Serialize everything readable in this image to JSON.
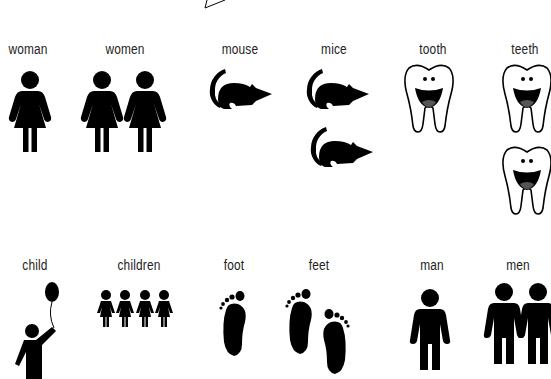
{
  "title_fragment": "",
  "colors": {
    "ink": "#000000",
    "background": "#ffffff",
    "text": "#222222"
  },
  "row1": [
    {
      "word": "woman",
      "icon": "woman-icon",
      "count": 1
    },
    {
      "word": "women",
      "icon": "woman-icon",
      "count": 2
    },
    {
      "word": "mouse",
      "icon": "mouse-icon",
      "count": 1
    },
    {
      "word": "mice",
      "icon": "mouse-icon",
      "count": 2
    },
    {
      "word": "tooth",
      "icon": "tooth-icon",
      "count": 1
    },
    {
      "word": "teeth",
      "icon": "tooth-icon",
      "count": 2
    }
  ],
  "row2": [
    {
      "word": "child",
      "icon": "child-balloon-icon",
      "count": 1
    },
    {
      "word": "children",
      "icon": "children-icon",
      "count": 4
    },
    {
      "word": "foot",
      "icon": "foot-icon",
      "count": 1
    },
    {
      "word": "feet",
      "icon": "foot-icon",
      "count": 2
    },
    {
      "word": "man",
      "icon": "man-icon",
      "count": 1
    },
    {
      "word": "men",
      "icon": "man-icon",
      "count": 2
    }
  ]
}
